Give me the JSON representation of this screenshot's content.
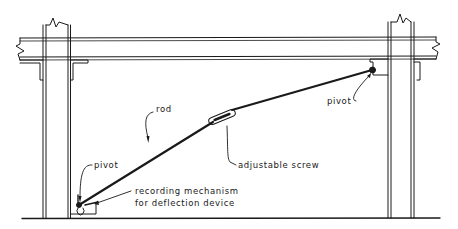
{
  "diagram": {
    "type": "structural deflection-measurement setup (elevation view)",
    "colors": {
      "ink": "#1a1a1a",
      "background": "#ffffff"
    },
    "components": {
      "beam": "horizontal beam with break lines at both ends",
      "left_column": "column with break line at top",
      "right_column": "column with break line at top",
      "floor": "ground line",
      "rod": "diagonal rod from lower-left pivot to upper-right pivot",
      "turnbuckle": "adjustable screw in rod",
      "recording_box": "recording mechanism at base of left column"
    },
    "labels": {
      "rod": "rod",
      "pivot_right": "pivot",
      "adjustable_screw": "adjustable screw",
      "pivot_left": "pivot",
      "recording_line1": "recording mechanism",
      "recording_line2": "for deflection device"
    }
  }
}
